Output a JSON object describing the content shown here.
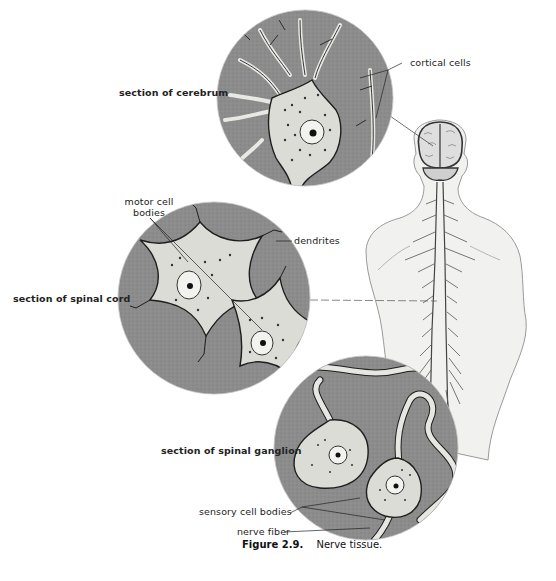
{
  "figure": {
    "caption_number": "Figure 2.9.",
    "caption_text": "Nerve tissue.",
    "colors": {
      "background": "#ffffff",
      "tissue_gray": "#8a8a8a",
      "cell_fill": "#dcdcd8",
      "outline": "#1e1e1e",
      "label_text": "#222222"
    }
  },
  "panels": {
    "cerebrum": {
      "label": "section of cerebrum",
      "callout": "cortical cells"
    },
    "spinal_cord": {
      "label": "section of spinal cord",
      "callout_cells": "motor cell bodies",
      "callout_dendrites": "dendrites"
    },
    "spinal_ganglion": {
      "label": "section of spinal ganglion",
      "callout_cells": "sensory cell bodies",
      "callout_fiber": "nerve fiber"
    }
  },
  "labels": {
    "cortical_cells": "cortical cells",
    "motor_cell_line1": "motor cell",
    "motor_cell_line2": "bodies",
    "dendrites": "dendrites",
    "section_cerebrum": "section of cerebrum",
    "section_spinal_cord": "section of spinal cord",
    "section_spinal_ganglion": "section of spinal ganglion",
    "sensory_cell_bodies": "sensory cell bodies",
    "nerve_fiber": "nerve fiber"
  }
}
